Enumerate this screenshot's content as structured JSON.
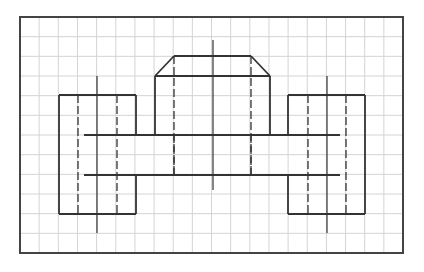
{
  "drawing": {
    "title": "Orthographic view on grid paper",
    "background": "#ffffff",
    "grid": {
      "x0": 20,
      "y0": 17,
      "x1": 403,
      "y1": 253,
      "cols": 20,
      "rows": 12,
      "color": "#d4d4d4"
    },
    "border_color": "#444444",
    "line_color": "#333333",
    "solid_lines": [
      [
        59,
        95,
        136,
        95
      ],
      [
        59,
        95,
        59,
        214
      ],
      [
        59,
        214,
        136,
        214
      ],
      [
        136,
        95,
        136,
        135
      ],
      [
        136,
        175,
        136,
        214
      ],
      [
        288,
        95,
        365,
        95
      ],
      [
        365,
        95,
        365,
        214
      ],
      [
        288,
        214,
        365,
        214
      ],
      [
        288,
        95,
        288,
        135
      ],
      [
        288,
        175,
        288,
        214
      ],
      [
        155,
        76,
        155,
        135
      ],
      [
        270,
        76,
        270,
        135
      ],
      [
        155,
        76,
        270,
        76
      ],
      [
        155,
        76,
        174,
        56
      ],
      [
        174,
        56,
        251,
        56
      ],
      [
        251,
        56,
        270,
        76
      ],
      [
        84,
        135,
        340,
        135
      ],
      [
        84,
        175,
        340,
        175
      ]
    ],
    "dashed_lines": [
      [
        78,
        95,
        78,
        214
      ],
      [
        117,
        95,
        117,
        214
      ],
      [
        308,
        95,
        308,
        214
      ],
      [
        346,
        95,
        346,
        214
      ],
      [
        174,
        56,
        174,
        175
      ],
      [
        251,
        56,
        251,
        175
      ],
      [
        174,
        135,
        174,
        175
      ],
      [
        251,
        135,
        251,
        175
      ]
    ],
    "center_lines": [
      [
        97,
        76,
        97,
        233
      ],
      [
        327,
        76,
        327,
        233
      ],
      [
        213,
        40,
        213,
        190
      ]
    ]
  }
}
